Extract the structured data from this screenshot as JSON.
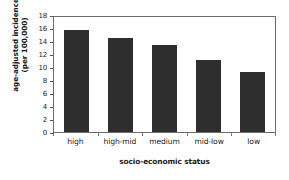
{
  "chart_data": {
    "type": "bar",
    "title": "",
    "categories": [
      "high",
      "high-mid",
      "medium",
      "mid-low",
      "low"
    ],
    "values": [
      15.7,
      14.4,
      13.4,
      11.1,
      9.2
    ],
    "xlabel": "socio-economic status",
    "ylabel_line1": "age-adjusted incidence",
    "ylabel_line2": "(per 100,000)",
    "ylim": [
      0,
      18
    ],
    "ytick_step": 2,
    "yticks": [
      0,
      2,
      4,
      6,
      8,
      10,
      12,
      14,
      16,
      18
    ],
    "ytick_labels": [
      "0",
      "2",
      "4",
      "6",
      "8",
      "10",
      "12",
      "14",
      "16",
      "18"
    ],
    "grid": false,
    "legend": null,
    "bar_color": "#2e2e2e",
    "frame_color": "#6b6b6b",
    "background_color": "#ffffff"
  }
}
